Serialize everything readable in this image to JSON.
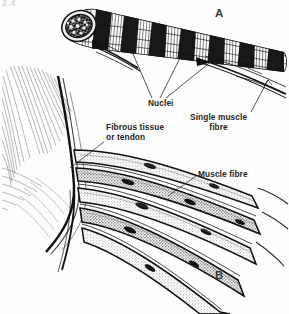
{
  "figure": {
    "kind": "anatomical-line-drawing",
    "background_color": "#fdfdfd",
    "ink_color": "#1a1a1a",
    "stipple_color": "#9a9a9a",
    "corner_mark": "2.4",
    "panels": [
      {
        "id": "A",
        "letter": "A",
        "description": "Cut muscle bundle showing striated fibres and cross-sectioned end"
      },
      {
        "id": "B",
        "letter": "B",
        "description": "Muscle fibres inserting into fibrous tissue or tendon"
      }
    ],
    "callouts": [
      {
        "id": "nuclei",
        "text": "Nuclei",
        "lines": [
          "Nuclei"
        ],
        "align": "left"
      },
      {
        "id": "single-muscle-fibre",
        "text": "Single muscle fibre",
        "lines": [
          "Single muscle",
          "fibre"
        ],
        "align": "center"
      },
      {
        "id": "fibrous-tissue-or-tendon",
        "text": "Fibrous tissue or tendon",
        "lines": [
          "Fibrous tissue",
          "or tendon"
        ],
        "align": "left"
      },
      {
        "id": "muscle-fibre",
        "text": "Muscle fibre",
        "lines": [
          "Muscle fibre"
        ],
        "align": "left"
      }
    ]
  }
}
